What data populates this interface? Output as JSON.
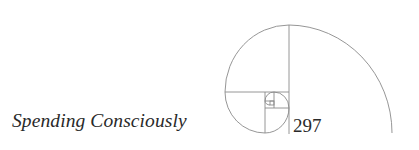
{
  "header": {
    "running_title": "Spending Consciously",
    "page_number": "297"
  },
  "ornament": {
    "name": "golden-spiral",
    "stroke_color": "#8a8a8a"
  }
}
